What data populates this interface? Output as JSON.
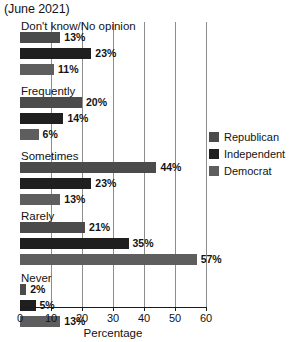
{
  "chart_data": {
    "type": "bar",
    "orientation": "horizontal",
    "title": "(June 2021)",
    "xlabel": "Percentage",
    "ylabel": "",
    "xlim": [
      0,
      60
    ],
    "xticks": [
      0,
      10,
      20,
      30,
      40,
      50,
      60
    ],
    "grid": true,
    "legend_position": "right",
    "categories": [
      "Don't know/No opinion",
      "Frequently",
      "Sometimes",
      "Rarely",
      "Never"
    ],
    "series": [
      {
        "name": "Republican",
        "color": "#4b4b4b",
        "values": [
          13,
          20,
          44,
          21,
          2
        ],
        "labels": [
          "13%",
          "20%",
          "44%",
          "21%",
          "2%"
        ]
      },
      {
        "name": "Independent",
        "color": "#1f1f1f",
        "values": [
          23,
          14,
          23,
          35,
          5
        ],
        "labels": [
          "23%",
          "14%",
          "23%",
          "35%",
          "5%"
        ]
      },
      {
        "name": "Democrat",
        "color": "#5e5e5e",
        "values": [
          11,
          6,
          13,
          57,
          13
        ],
        "labels": [
          "11%",
          "6%",
          "13%",
          "57%",
          "13%"
        ]
      }
    ]
  },
  "axis": {
    "tick_labels": [
      "0",
      "10",
      "20",
      "30",
      "40",
      "50",
      "60"
    ],
    "x_title": "Percentage"
  },
  "legend": {
    "items": [
      {
        "label": "Republican",
        "color": "#4b4b4b"
      },
      {
        "label": "Independent",
        "color": "#1f1f1f"
      },
      {
        "label": "Democrat",
        "color": "#5e5e5e"
      }
    ]
  },
  "header": {
    "title": "(June 2021)"
  }
}
